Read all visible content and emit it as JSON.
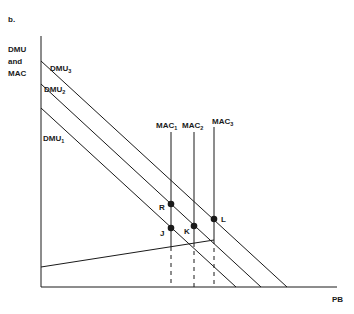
{
  "figure": {
    "panel_label": "b.",
    "y_axis_label_lines": [
      "DMU",
      "and",
      "MAC"
    ],
    "x_axis_label": "PB"
  },
  "curves": {
    "dmu": [
      {
        "name": "DMU",
        "sub": "3"
      },
      {
        "name": "DMU",
        "sub": "2"
      },
      {
        "name": "DMU",
        "sub": "1"
      }
    ],
    "mac": [
      {
        "name": "MAC",
        "sub": "1"
      },
      {
        "name": "MAC",
        "sub": "2"
      },
      {
        "name": "MAC",
        "sub": "3"
      }
    ]
  },
  "points": [
    {
      "label": "R"
    },
    {
      "label": "J"
    },
    {
      "label": "K"
    },
    {
      "label": "L"
    }
  ],
  "colors": {
    "ink": "#1a1a1a",
    "background": "#ffffff"
  }
}
